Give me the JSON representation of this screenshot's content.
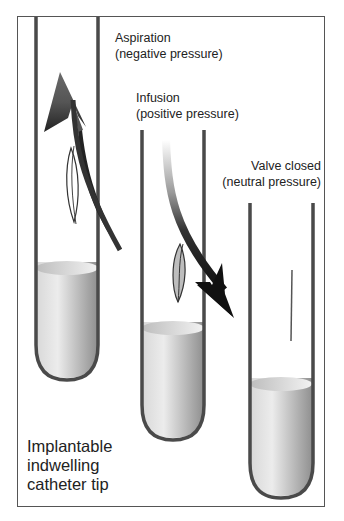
{
  "figure": {
    "caption_lines": [
      "Implantable",
      "indwelling",
      "catheter tip"
    ]
  },
  "panels": [
    {
      "id": "aspiration",
      "title": "Aspiration",
      "subtitle": "(negative pressure)",
      "arrow_direction": "up",
      "valve_state": "open-inward"
    },
    {
      "id": "infusion",
      "title": "Infusion",
      "subtitle": "(positive pressure)",
      "arrow_direction": "down",
      "valve_state": "open-outward"
    },
    {
      "id": "valve-closed",
      "title": "Valve closed",
      "subtitle": "(neutral pressure)",
      "arrow_direction": "none",
      "valve_state": "closed"
    }
  ],
  "colors": {
    "tube_wall": "#4a4a4a",
    "liquid_light": "#e2e2e2",
    "liquid_dark": "#9a9a9a",
    "arrow_up": "#5a5a5a",
    "arrow_down": "#1a1a1a",
    "frame": "#555555"
  }
}
